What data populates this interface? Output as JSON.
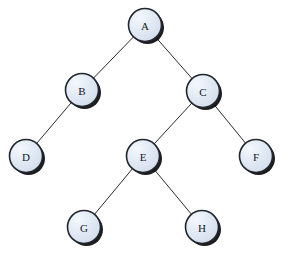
{
  "diagram": {
    "background_color": "#ffffff",
    "node_fill_color": "#dde6f2",
    "node_highlight_color": "#f2f7fc",
    "node_stroke_color": "#20252e",
    "node_shadow_color": "#0a0a0a",
    "edge_color": "#2b2b2b",
    "label_color": "#15181d",
    "node_radius": 16.5,
    "width": 281,
    "height": 254
  },
  "nodes": [
    {
      "id": "A",
      "label": "A",
      "x": 145,
      "y": 25
    },
    {
      "id": "B",
      "label": "B",
      "x": 82,
      "y": 90
    },
    {
      "id": "C",
      "label": "C",
      "x": 203,
      "y": 91
    },
    {
      "id": "D",
      "label": "D",
      "x": 26,
      "y": 156
    },
    {
      "id": "E",
      "label": "E",
      "x": 143,
      "y": 156
    },
    {
      "id": "F",
      "label": "F",
      "x": 256,
      "y": 156
    },
    {
      "id": "G",
      "label": "G",
      "x": 84,
      "y": 227
    },
    {
      "id": "H",
      "label": "H",
      "x": 202,
      "y": 227
    }
  ],
  "edges": [
    {
      "from": "A",
      "to": "B"
    },
    {
      "from": "A",
      "to": "C"
    },
    {
      "from": "B",
      "to": "D"
    },
    {
      "from": "C",
      "to": "E"
    },
    {
      "from": "C",
      "to": "F"
    },
    {
      "from": "E",
      "to": "G"
    },
    {
      "from": "E",
      "to": "H"
    }
  ]
}
